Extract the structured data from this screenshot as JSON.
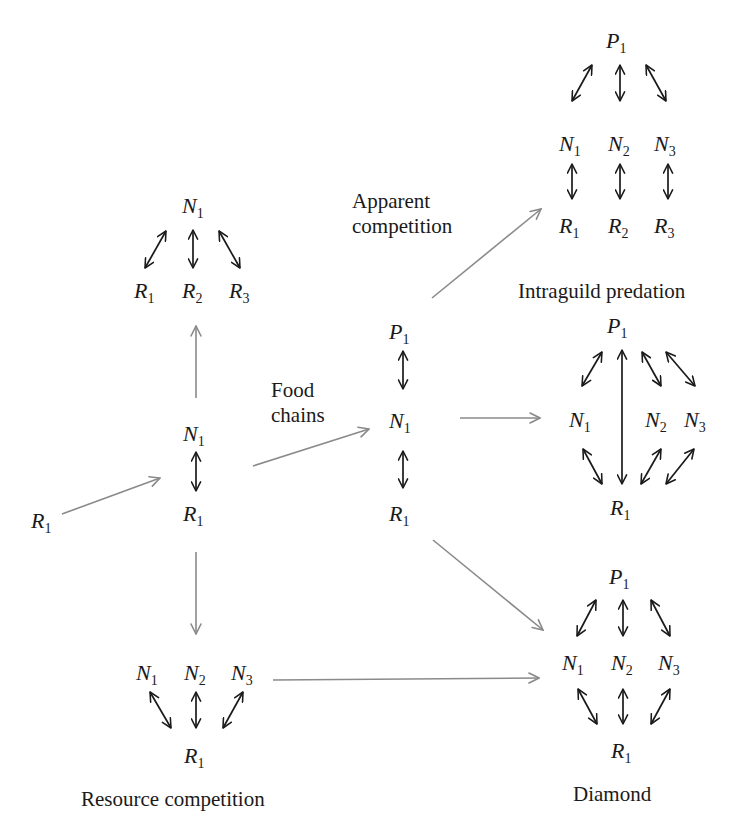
{
  "diagram": {
    "nodes_modules": {
      "start": {
        "species": [
          {
            "base": "R",
            "sub": "1"
          }
        ]
      },
      "consumer_resource": {
        "species": [
          {
            "base": "N",
            "sub": "1"
          },
          {
            "base": "R",
            "sub": "1"
          }
        ]
      },
      "generalist": {
        "top": {
          "base": "N",
          "sub": "1"
        },
        "bottom": [
          {
            "base": "R",
            "sub": "1"
          },
          {
            "base": "R",
            "sub": "2"
          },
          {
            "base": "R",
            "sub": "3"
          }
        ]
      },
      "food_chain": {
        "species": [
          {
            "base": "P",
            "sub": "1"
          },
          {
            "base": "N",
            "sub": "1"
          },
          {
            "base": "R",
            "sub": "1"
          }
        ]
      },
      "apparent_competition": {
        "top": {
          "base": "P",
          "sub": "1"
        },
        "middle": [
          {
            "base": "N",
            "sub": "1"
          },
          {
            "base": "N",
            "sub": "2"
          },
          {
            "base": "N",
            "sub": "3"
          }
        ],
        "bottom": [
          {
            "base": "R",
            "sub": "1"
          },
          {
            "base": "R",
            "sub": "2"
          },
          {
            "base": "R",
            "sub": "3"
          }
        ]
      },
      "intraguild_predation": {
        "top": {
          "base": "P",
          "sub": "1"
        },
        "middle": [
          {
            "base": "N",
            "sub": "1"
          },
          {
            "base": "N",
            "sub": "2"
          },
          {
            "base": "N",
            "sub": "3"
          }
        ],
        "bottom": {
          "base": "R",
          "sub": "1"
        }
      },
      "resource_competition": {
        "top": [
          {
            "base": "N",
            "sub": "1"
          },
          {
            "base": "N",
            "sub": "2"
          },
          {
            "base": "N",
            "sub": "3"
          }
        ],
        "bottom": {
          "base": "R",
          "sub": "1"
        }
      },
      "diamond": {
        "top": {
          "base": "P",
          "sub": "1"
        },
        "middle": [
          {
            "base": "N",
            "sub": "1"
          },
          {
            "base": "N",
            "sub": "2"
          },
          {
            "base": "N",
            "sub": "3"
          }
        ],
        "bottom": {
          "base": "R",
          "sub": "1"
        }
      }
    },
    "labels": {
      "apparent_line1": "Apparent",
      "apparent_line2": "competition",
      "food_line1": "Food",
      "food_line2": "chains",
      "intraguild": "Intraguild predation",
      "resource_competition": "Resource competition",
      "diamond": "Diamond"
    },
    "colors": {
      "flow_arrow": "#8a8a8a",
      "interaction_arrow": "#1a1a1a",
      "text": "#1a1a1a",
      "background": "#ffffff"
    }
  }
}
